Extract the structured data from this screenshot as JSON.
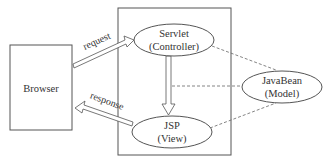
{
  "diagram": {
    "nodes": {
      "browser": {
        "label": "Browser"
      },
      "servlet": {
        "line1": "Servlet",
        "line2": "(Controller)"
      },
      "jsp": {
        "line1": "JSP",
        "line2": "(View)"
      },
      "javabean": {
        "line1": "JavaBean",
        "line2": "(Model)"
      }
    },
    "edges": {
      "request": {
        "label": "request"
      },
      "response": {
        "label": "response"
      }
    },
    "colors": {
      "stroke": "#555555",
      "dashed": "#666666",
      "text": "#333333",
      "background": "#ffffff"
    }
  }
}
